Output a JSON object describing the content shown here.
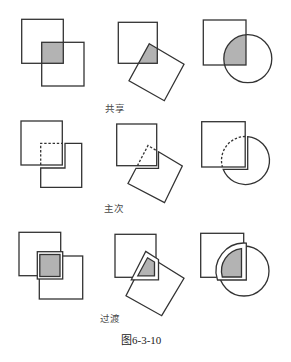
{
  "figure": {
    "caption": "图6-3-10",
    "rows": [
      {
        "label": "共享",
        "panels": [
          {
            "shapes": [
              "square",
              "square"
            ],
            "overlap": "shaded"
          },
          {
            "shapes": [
              "square",
              "rotated-square"
            ],
            "overlap": "shaded"
          },
          {
            "shapes": [
              "square",
              "circle"
            ],
            "overlap": "shaded"
          }
        ]
      },
      {
        "label": "主次",
        "panels": [
          {
            "shapes": [
              "square",
              "square"
            ],
            "overlap": "hidden-dashed"
          },
          {
            "shapes": [
              "square",
              "rotated-square"
            ],
            "overlap": "hidden-dashed"
          },
          {
            "shapes": [
              "square",
              "circle"
            ],
            "overlap": "hidden-dashed"
          }
        ]
      },
      {
        "label": "过渡",
        "panels": [
          {
            "shapes": [
              "square",
              "square"
            ],
            "overlap": "shaded-framed"
          },
          {
            "shapes": [
              "square",
              "rotated-square"
            ],
            "overlap": "shaded-framed"
          },
          {
            "shapes": [
              "square",
              "circle"
            ],
            "overlap": "shaded-framed"
          }
        ]
      }
    ]
  },
  "colors": {
    "stroke": "#333333",
    "overlap_fill": "#b3b3b3",
    "frame_fill": "#ffffff",
    "background": "#ffffff"
  }
}
